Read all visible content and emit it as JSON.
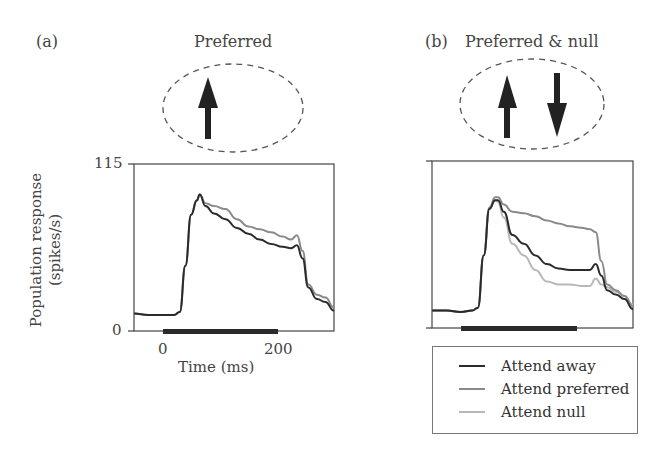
{
  "figure": {
    "panel_a": {
      "label": "(a)",
      "title": "Preferred",
      "stimulus_arrows": [
        "up"
      ]
    },
    "panel_b": {
      "label": "(b)",
      "title": "Preferred & null",
      "stimulus_arrows": [
        "up",
        "down"
      ]
    },
    "y_axis": {
      "label_line1": "Population response",
      "label_line2": "(spikes/s)",
      "tick_top": "115",
      "tick_bottom": "0"
    },
    "x_axis": {
      "label": "Time (ms)",
      "tick_0": "0",
      "tick_200": "200"
    },
    "legend": {
      "items": [
        {
          "label": "Attend away",
          "color": "#2b2b2b"
        },
        {
          "label": "Attend preferred",
          "color": "#8a8a8a"
        },
        {
          "label": "Attend null",
          "color": "#b8b8b8"
        }
      ]
    }
  },
  "chart_data": [
    {
      "type": "line",
      "title": "Preferred",
      "panel": "(a)",
      "xlabel": "Time (ms)",
      "ylabel": "Population response (spikes/s)",
      "xlim": [
        -50,
        300
      ],
      "ylim": [
        0,
        115
      ],
      "xticks": [
        0,
        200
      ],
      "yticks": [
        0,
        115
      ],
      "stimulus_bar": [
        0,
        200
      ],
      "grid": false,
      "x": [
        -50,
        -25,
        0,
        20,
        30,
        40,
        50,
        60,
        65,
        75,
        90,
        110,
        130,
        150,
        170,
        190,
        210,
        225,
        235,
        245,
        255,
        270,
        285,
        300
      ],
      "series": [
        {
          "name": "Attend away",
          "color": "#2b2b2b",
          "values": [
            12,
            11,
            11,
            11,
            13,
            45,
            80,
            90,
            94,
            86,
            81,
            77,
            71,
            67,
            63,
            60,
            58,
            57,
            59,
            50,
            30,
            22,
            20,
            14
          ]
        },
        {
          "name": "Attend preferred",
          "color": "#8a8a8a",
          "values": [
            12,
            11,
            11,
            11,
            13,
            45,
            80,
            90,
            94,
            88,
            86,
            84,
            77,
            72,
            70,
            68,
            65,
            63,
            66,
            55,
            32,
            25,
            23,
            16
          ]
        }
      ]
    },
    {
      "type": "line",
      "title": "Preferred & null",
      "panel": "(b)",
      "xlabel": "Time (ms)",
      "ylabel": "Population response (spikes/s)",
      "xlim": [
        -50,
        300
      ],
      "ylim": [
        0,
        115
      ],
      "stimulus_bar": [
        0,
        200
      ],
      "grid": false,
      "x": [
        -50,
        -25,
        0,
        20,
        30,
        40,
        50,
        60,
        65,
        75,
        90,
        110,
        130,
        150,
        170,
        190,
        210,
        225,
        235,
        245,
        255,
        270,
        285,
        300
      ],
      "series": [
        {
          "name": "Attend away",
          "color": "#2b2b2b",
          "values": [
            12,
            12,
            11,
            12,
            14,
            50,
            82,
            88,
            88,
            80,
            64,
            58,
            50,
            44,
            41,
            40,
            40,
            40,
            44,
            36,
            26,
            23,
            20,
            13
          ]
        },
        {
          "name": "Attend preferred",
          "color": "#8a8a8a",
          "values": [
            12,
            12,
            11,
            12,
            14,
            50,
            83,
            90,
            90,
            85,
            80,
            79,
            77,
            74,
            72,
            70,
            69,
            68,
            66,
            46,
            30,
            26,
            22,
            15
          ]
        },
        {
          "name": "Attend null",
          "color": "#b8b8b8",
          "values": [
            12,
            12,
            11,
            12,
            14,
            50,
            82,
            88,
            87,
            76,
            58,
            50,
            40,
            32,
            30,
            30,
            29,
            29,
            34,
            30,
            28,
            25,
            22,
            16
          ]
        }
      ]
    }
  ]
}
